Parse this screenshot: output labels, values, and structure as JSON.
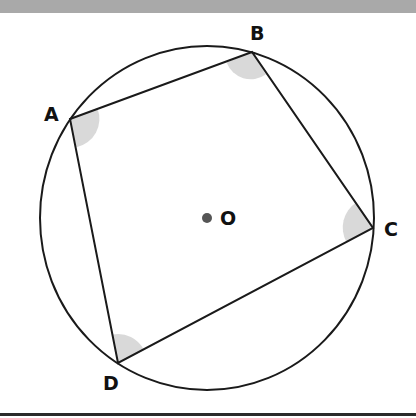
{
  "diagram": {
    "type": "cyclic quadrilateral inscribed in circle",
    "circle": {
      "cx": 207,
      "cy": 218,
      "rx": 167,
      "ry": 172,
      "stroke": "#1a1a1a"
    },
    "center": {
      "label": "O",
      "x": 207,
      "y": 218,
      "dot_color": "#555555"
    },
    "vertices": [
      {
        "label": "A",
        "x": 70,
        "y": 119,
        "lx": 44,
        "ly": 121
      },
      {
        "label": "B",
        "x": 252,
        "y": 52,
        "lx": 250,
        "ly": 40
      },
      {
        "label": "C",
        "x": 373,
        "y": 228,
        "lx": 384,
        "ly": 236
      },
      {
        "label": "D",
        "x": 118,
        "y": 363,
        "lx": 103,
        "ly": 388
      }
    ],
    "angle_marker_color": "#d9d9d9"
  }
}
